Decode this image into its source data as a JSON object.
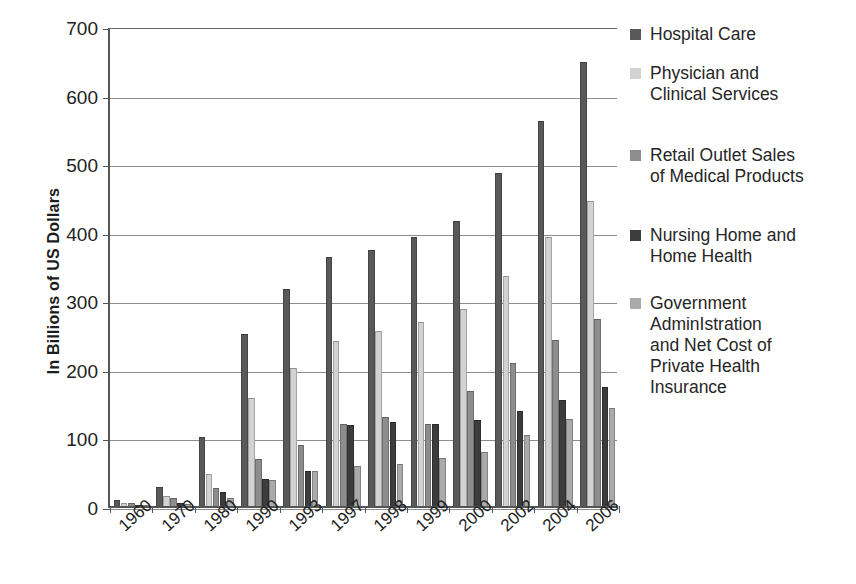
{
  "chart_data": {
    "type": "bar",
    "title": "",
    "subtitle": "",
    "xlabel": "",
    "ylabel": "In Billions of US Dollars",
    "ylim": [
      0,
      700
    ],
    "ytick_values": [
      0,
      100,
      200,
      300,
      400,
      500,
      600,
      700
    ],
    "ytick_labels": [
      "0",
      "100",
      "200",
      "300",
      "400",
      "500",
      "600",
      "700"
    ],
    "grid": true,
    "legend_position": "right",
    "categories": [
      "1960",
      "1970",
      "1980",
      "1990",
      "1993",
      "1997",
      "1998",
      "1999",
      "2000",
      "2002",
      "2004",
      "2006"
    ],
    "series": [
      {
        "name": "Hospital Care",
        "color": "#595959",
        "values": [
          9,
          28,
          101,
          251,
          317,
          363,
          374,
          393,
          415,
          486,
          562,
          648
        ]
      },
      {
        "name": "Physician and\nClinical Services",
        "color": "#d2d2d2",
        "values": [
          5,
          14,
          47,
          157,
          201,
          240,
          255,
          268,
          288,
          336,
          393,
          445
        ]
      },
      {
        "name": "Retail Outlet Sales\nof Medical Products",
        "color": "#8d8d8d",
        "values": [
          4,
          12,
          26,
          69,
          89,
          120,
          130,
          120,
          168,
          208,
          242,
          273
        ]
      },
      {
        "name": "Nursing Home and\nHome Health",
        "color": "#3c3c3c",
        "values": [
          1,
          4,
          20,
          39,
          51,
          118,
          123,
          120,
          125,
          138,
          155,
          173
        ]
      },
      {
        "name": "Government\nAdminIstration\nand Net Cost of\nPrivate Health\nInsurance",
        "color": "#aaaaaa",
        "values": [
          1,
          3,
          12,
          38,
          51,
          58,
          62,
          70,
          79,
          103,
          127,
          143
        ]
      }
    ]
  },
  "legend": {
    "items": [
      {
        "label": "Hospital Care",
        "swatch_color": "#595959",
        "swatch_icon": "legend-square-icon"
      },
      {
        "label": "Physician and\nClinical Services",
        "swatch_color": "#d2d2d2",
        "swatch_icon": "legend-square-icon"
      },
      {
        "label": "Retail Outlet Sales\nof Medical Products",
        "swatch_color": "#8d8d8d",
        "swatch_icon": "legend-square-icon"
      },
      {
        "label": "Nursing Home and\nHome Health",
        "swatch_color": "#3c3c3c",
        "swatch_icon": "legend-square-icon"
      },
      {
        "label": "Government\nAdminIstration\nand Net Cost of\nPrivate Health\nInsurance",
        "swatch_color": "#aaaaaa",
        "swatch_icon": "legend-square-icon"
      }
    ]
  }
}
